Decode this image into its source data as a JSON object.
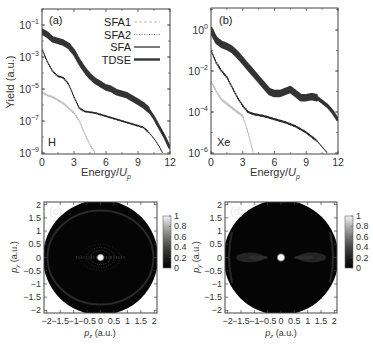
{
  "chart_data": [
    {
      "panel": "(a)",
      "type": "line",
      "title": "",
      "annotation": "H",
      "xlabel": "Energy/U_p",
      "ylabel": "Yield (a.u.)",
      "xlim": [
        0,
        12
      ],
      "ylim_log10": [
        -9,
        0
      ],
      "yscale": "log",
      "xticks": [
        0,
        3,
        6,
        9,
        12
      ],
      "yticks_labels": [
        "10^-1",
        "10^-3",
        "10^-5",
        "10^-7",
        "10^-9"
      ],
      "yticks_log10": [
        -1,
        -3,
        -5,
        -7,
        -9
      ],
      "legend": [
        "SFA1",
        "SFA2",
        "SFA",
        "TDSE"
      ],
      "legend_position": "upper right",
      "series": [
        {
          "name": "TDSE",
          "style": "thick dark, oscillating",
          "x": [
            0,
            0.5,
            1,
            1.5,
            2,
            2.5,
            3,
            3.5,
            4,
            4.5,
            5,
            5.5,
            6,
            6.5,
            7,
            7.5,
            8,
            8.5,
            9,
            9.5,
            10,
            10.5,
            11,
            11.5,
            12
          ],
          "log10_y": [
            -1.4,
            -1.6,
            -1.9,
            -2.0,
            -2.1,
            -2.3,
            -2.7,
            -3.3,
            -3.8,
            -4.2,
            -4.5,
            -4.7,
            -4.9,
            -5.0,
            -5.2,
            -5.3,
            -5.4,
            -5.6,
            -5.8,
            -6.0,
            -6.3,
            -6.8,
            -7.4,
            -8.0,
            -8.7
          ]
        },
        {
          "name": "SFA",
          "style": "thin black",
          "x": [
            0,
            0.5,
            1,
            1.5,
            2,
            2.5,
            3,
            3.5,
            4,
            5,
            6,
            7,
            8,
            9,
            9.5,
            10,
            10.5,
            11,
            11.3
          ],
          "log10_y": [
            -2.5,
            -3.3,
            -3.9,
            -4.2,
            -4.3,
            -4.7,
            -5.5,
            -6.2,
            -6.4,
            -6.5,
            -6.7,
            -6.9,
            -7.1,
            -7.3,
            -7.4,
            -7.7,
            -8.1,
            -8.6,
            -9.0
          ]
        },
        {
          "name": "SFA1",
          "style": "light gray",
          "x": [
            0,
            0.5,
            1,
            1.5,
            2,
            2.5,
            3,
            3.5,
            4,
            4.5,
            5
          ],
          "log10_y": [
            -5.2,
            -5.4,
            -5.5,
            -5.7,
            -5.9,
            -6.2,
            -6.5,
            -7.0,
            -7.8,
            -8.5,
            -9.0
          ]
        },
        {
          "name": "SFA2",
          "style": "gray dotted",
          "x": [],
          "log10_y": []
        }
      ]
    },
    {
      "panel": "(b)",
      "type": "line",
      "title": "",
      "annotation": "Xe",
      "xlabel": "Energy/U_p",
      "ylabel": "",
      "xlim": [
        0,
        12
      ],
      "ylim_log10": [
        -6,
        1
      ],
      "yscale": "log",
      "xticks": [
        0,
        3,
        6,
        9,
        12
      ],
      "yticks_labels": [
        "10^0",
        "10^-2",
        "10^-4",
        "10^-6"
      ],
      "yticks_log10": [
        0,
        -2,
        -4,
        -6
      ],
      "series": [
        {
          "name": "TDSE",
          "style": "thick dark, oscillating",
          "x": [
            0,
            0.5,
            1,
            1.5,
            2,
            2.5,
            3,
            3.5,
            4,
            4.5,
            5,
            5.5,
            6,
            6.5,
            7,
            7.5,
            8,
            8.5,
            9,
            9.5,
            10,
            10.5,
            11,
            11.5,
            12
          ],
          "log10_y": [
            0.0,
            -0.5,
            -0.7,
            -0.8,
            -0.95,
            -1.2,
            -1.5,
            -1.8,
            -2.1,
            -2.4,
            -2.7,
            -3.0,
            -3.1,
            -3.1,
            -3.0,
            -2.9,
            -3.1,
            -3.3,
            -3.3,
            -3.25,
            -3.3,
            -3.5,
            -3.7,
            -4.0,
            -4.4
          ]
        },
        {
          "name": "SFA",
          "style": "thin black",
          "x": [
            0,
            0.5,
            1,
            1.5,
            2,
            2.5,
            3,
            3.5,
            4,
            5,
            6,
            7,
            8,
            9,
            9.5,
            10,
            10.5,
            11
          ],
          "log10_y": [
            -1.0,
            -1.6,
            -2.0,
            -2.3,
            -2.8,
            -3.3,
            -3.7,
            -4.0,
            -4.1,
            -4.2,
            -4.35,
            -4.5,
            -4.7,
            -5.0,
            -5.2,
            -5.4,
            -5.7,
            -6.0
          ]
        },
        {
          "name": "SFA1",
          "style": "light gray",
          "x": [
            0,
            0.5,
            1,
            1.5,
            2,
            2.5,
            3,
            3.5,
            4
          ],
          "log10_y": [
            -2.5,
            -3.0,
            -3.4,
            -3.6,
            -3.8,
            -4.0,
            -4.2,
            -5.0,
            -6.0
          ]
        }
      ]
    },
    {
      "panel": "(c)",
      "type": "heatmap",
      "xlabel": "p_z (a.u.)",
      "ylabel": "p_y (a.u.)",
      "xlim": [
        -2.1,
        2.1
      ],
      "ylim": [
        -2.1,
        2.1
      ],
      "xticks": [
        "-2",
        "-1.5",
        "-1",
        "-0.5",
        "0",
        "0.5",
        "1",
        "1.5",
        "2"
      ],
      "yticks": [
        "2",
        "1.5",
        "1",
        "0.5",
        "0",
        "-0.5",
        "-1",
        "-1.5",
        "-2"
      ],
      "colorbar_ticks": [
        "1",
        "0.8",
        "0.6",
        "0.4",
        "0.2",
        "0"
      ],
      "colorbar_range": [
        0,
        1
      ],
      "description": "Dark circular momentum distribution radius ~2.1 a.u., bright center spot, concentric interference rings near center, faint outer ring ~1.5 a.u."
    },
    {
      "panel": "(d)",
      "type": "heatmap",
      "xlabel": "p_z (a.u.)",
      "ylabel": "p_y (a.u.)",
      "xlim": [
        -2.1,
        2.1
      ],
      "ylim": [
        -2.1,
        2.1
      ],
      "xticks": [
        "-2",
        "-1.5",
        "-1",
        "-0.5",
        "0",
        "0.5",
        "1",
        "1.5",
        "2"
      ],
      "yticks": [
        "2",
        "1.5",
        "1",
        "0.5",
        "0",
        "-0.5",
        "-1",
        "-1.5",
        "-2"
      ],
      "colorbar_ticks": [
        "1",
        "0.8",
        "0.6",
        "0.4",
        "0.2",
        "0"
      ],
      "colorbar_range": [
        0,
        1
      ],
      "description": "Dark circular momentum distribution, bright center spot, two lobes along p_z axis at about ±1.1 a.u., faint outer arcs near edge"
    }
  ],
  "panels": {
    "a": {
      "label": "(a)",
      "atom": "H",
      "xlabel_main": "Energy/",
      "xlabel_sub": "p",
      "xlabel_u": "U",
      "ylabel": "Yield (a.u.)",
      "xticks": [
        "0",
        "3",
        "6",
        "9",
        "12"
      ],
      "yticks": [
        {
          "base": "10",
          "exp": "−1"
        },
        {
          "base": "10",
          "exp": "−3"
        },
        {
          "base": "10",
          "exp": "−5"
        },
        {
          "base": "10",
          "exp": "−7"
        },
        {
          "base": "10",
          "exp": "−9"
        }
      ]
    },
    "b": {
      "label": "(b)",
      "atom": "Xe",
      "xlabel_main": "Energy/",
      "xlabel_sub": "p",
      "xlabel_u": "U",
      "xticks": [
        "0",
        "3",
        "6",
        "9",
        "12"
      ],
      "yticks": [
        {
          "base": "10",
          "exp": "0"
        },
        {
          "base": "10",
          "exp": "−2"
        },
        {
          "base": "10",
          "exp": "−4"
        },
        {
          "base": "10",
          "exp": "−6"
        }
      ]
    },
    "c": {
      "label": "(c)",
      "ylabel_p": "p",
      "ylabel_sub": "y",
      "ylabel_rest": " (a.u.)",
      "xlabel_p": "p",
      "xlabel_sub": "z",
      "xlabel_rest": " (a.u.)",
      "xticks": [
        "−2",
        "−1.5",
        "−1",
        "−0.5",
        "0",
        "0.5",
        "1",
        "1.5",
        "2"
      ],
      "yticks": [
        "2",
        "1.5",
        "1",
        "0.5",
        "0",
        "−0.5",
        "−1",
        "−1.5",
        "−2"
      ],
      "cbar": [
        "1",
        "0.8",
        "0.6",
        "0.4",
        "0.2",
        "0"
      ]
    },
    "d": {
      "label": "(d)",
      "ylabel_p": "p",
      "ylabel_sub": "y",
      "ylabel_rest": " (a.u.)",
      "xlabel_p": "p",
      "xlabel_sub": "z",
      "xlabel_rest": " (a.u.)",
      "xticks": [
        "−2",
        "−1.5",
        "−1",
        "−0.5",
        "0",
        "0.5",
        "1",
        "1.5",
        "2"
      ],
      "yticks": [
        "2",
        "1.5",
        "1",
        "0.5",
        "0",
        "−0.5",
        "−1",
        "−1.5",
        "−2"
      ],
      "cbar": [
        "1",
        "0.8",
        "0.6",
        "0.4",
        "0.2",
        "0"
      ]
    }
  },
  "legend": [
    {
      "label": "SFA1",
      "color": "#bbbbbb",
      "dash": "3,2",
      "width": 1
    },
    {
      "label": "SFA2",
      "color": "#888888",
      "dash": "1,1.5",
      "width": 1
    },
    {
      "label": "SFA",
      "color": "#222222",
      "dash": "",
      "width": 1.2
    },
    {
      "label": "TDSE",
      "color": "#333333",
      "dash": "",
      "width": 2.4
    }
  ],
  "colors": {
    "tdse": "#333333",
    "sfa": "#1a1a1a",
    "sfa1": "#bdbdbd",
    "axis": "#444444",
    "heat_bg": "#050505"
  }
}
